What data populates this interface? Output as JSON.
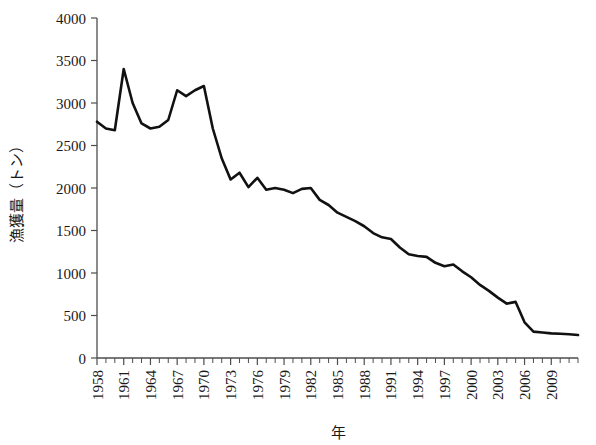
{
  "chart_data": {
    "type": "line",
    "title": "",
    "xlabel": "年",
    "ylabel": "漁獲量（トン）",
    "xlim": [
      1958,
      2012
    ],
    "ylim": [
      0,
      4000
    ],
    "grid": false,
    "legend": "none",
    "y_ticks": [
      0,
      500,
      1000,
      1500,
      2000,
      2500,
      3000,
      3500,
      4000
    ],
    "y_tick_labels": [
      "0",
      "500",
      "1000",
      "1500",
      "2000",
      "2500",
      "3000",
      "3500",
      "4000"
    ],
    "x_tick_labels": [
      "1958",
      "1961",
      "1964",
      "1967",
      "1970",
      "1973",
      "1976",
      "1979",
      "1982",
      "1985",
      "1988",
      "1991",
      "1994",
      "1997",
      "2000",
      "2003",
      "2006",
      "2009"
    ],
    "x_tick_label_years": [
      1958,
      1961,
      1964,
      1967,
      1970,
      1973,
      1976,
      1979,
      1982,
      1985,
      1988,
      1991,
      1994,
      1997,
      2000,
      2003,
      2006,
      2009
    ],
    "x_minor_tick_interval": 1,
    "series": [
      {
        "name": "漁獲量",
        "color": "#111111",
        "x": [
          1958,
          1959,
          1960,
          1961,
          1962,
          1963,
          1964,
          1965,
          1966,
          1967,
          1968,
          1969,
          1970,
          1971,
          1972,
          1973,
          1974,
          1975,
          1976,
          1977,
          1978,
          1979,
          1980,
          1981,
          1982,
          1983,
          1984,
          1985,
          1986,
          1987,
          1988,
          1989,
          1990,
          1991,
          1992,
          1993,
          1994,
          1995,
          1996,
          1997,
          1998,
          1999,
          2000,
          2001,
          2002,
          2003,
          2004,
          2005,
          2006,
          2007,
          2008,
          2009,
          2010,
          2011,
          2012
        ],
        "values": [
          2780,
          2700,
          2680,
          3400,
          3000,
          2760,
          2700,
          2720,
          2800,
          3150,
          3080,
          3150,
          3200,
          2700,
          2350,
          2100,
          2180,
          2010,
          2120,
          1980,
          2000,
          1980,
          1940,
          1990,
          2000,
          1860,
          1800,
          1710,
          1660,
          1610,
          1550,
          1470,
          1420,
          1400,
          1300,
          1220,
          1200,
          1190,
          1120,
          1080,
          1100,
          1020,
          950,
          860,
          790,
          710,
          640,
          660,
          420,
          310,
          300,
          290,
          285,
          280,
          270
        ]
      }
    ]
  },
  "axis_titles": {
    "x": "年",
    "y": "漁獲量（トン）"
  }
}
